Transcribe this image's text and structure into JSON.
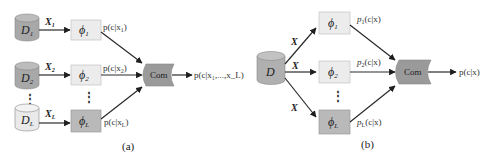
{
  "colors": {
    "cylinder_dark": "#a8a8a8",
    "cylinder_light": "#e6e6e6",
    "box_light": "#ececec",
    "box_dark": "#b9b9b9",
    "combiner": "#9a9a9a",
    "stroke": "#2a2a2a"
  },
  "panel_a": {
    "caption": "(a)",
    "sources": [
      {
        "label": "D",
        "sub": "1",
        "input": "X",
        "input_sub": "1"
      },
      {
        "label": "D",
        "sub": "2",
        "input": "X",
        "input_sub": "2"
      },
      {
        "label": "D",
        "sub": "L",
        "input": "X",
        "input_sub": "L"
      }
    ],
    "classifiers": [
      {
        "label": "ϕ",
        "sub": "1",
        "output": "p(c|x",
        "output_sub": "1",
        "output_end": ")"
      },
      {
        "label": "ϕ",
        "sub": "2",
        "output": "p(c|x",
        "output_sub": "2",
        "output_end": ")"
      },
      {
        "label": "ϕ",
        "sub": "L",
        "output": "p(c|x",
        "output_sub": "L",
        "output_end": ")"
      }
    ],
    "ellipsis": "⋮",
    "combiner": "Com",
    "final_output": "p(c|x₁,...,x_L)"
  },
  "panel_b": {
    "caption": "(b)",
    "source": {
      "label": "D"
    },
    "input_label": "X",
    "classifiers": [
      {
        "label": "ϕ",
        "sub": "1",
        "output": "p",
        "output_sub": "1",
        "output_end": "(c|x)"
      },
      {
        "label": "ϕ",
        "sub": "2",
        "output": "p",
        "output_sub": "2",
        "output_end": "(c|x)"
      },
      {
        "label": "ϕ",
        "sub": "L",
        "output": "p",
        "output_sub": "L",
        "output_end": "(c|x)"
      }
    ],
    "ellipsis": "⋮",
    "combiner": "Com",
    "final_output": "p(c|x)"
  }
}
